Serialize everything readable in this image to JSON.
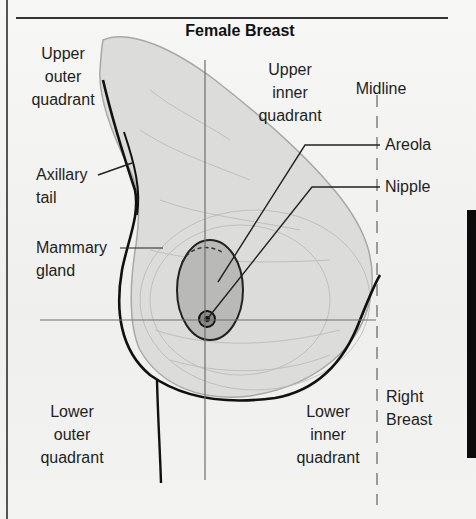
{
  "title": "Female Breast",
  "labels": {
    "upper_outer": "Upper\nouter\nquadrant",
    "upper_inner": "Upper\ninner\nquadrant",
    "midline": "Midline",
    "areola": "Areola",
    "nipple": "Nipple",
    "axillary_tail": "Axillary\ntail",
    "mammary_gland": "Mammary\ngland",
    "lower_outer": "Lower\nouter\nquadrant",
    "lower_inner": "Lower\ninner\nquadrant",
    "right_breast": "Right\nBreast"
  },
  "colors": {
    "outline": "#111111",
    "tissue": "#d9d9d7",
    "areola": "#b8b8b6",
    "guide": "#6e6e6e",
    "text": "#1e1e1e"
  }
}
